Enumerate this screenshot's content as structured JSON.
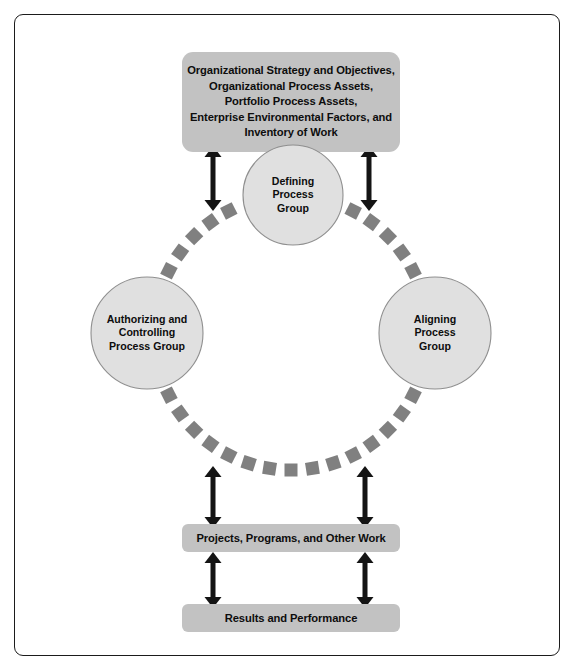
{
  "figure": {
    "background_color": "#ffffff",
    "frame_color": "#1b1b1b",
    "box_fill": "#c2c2c2",
    "circle_fill": "#e0e0e0",
    "circle_stroke": "#8f8f8f",
    "dash_color": "#808080",
    "arrow_color": "#141414",
    "text_color": "#0d0d0d"
  },
  "boxes": {
    "inputs": {
      "name": "Organizational Strategy and Objectives, Organizational Process Assets, Portfolio Process Assets, Enterprise Environmental Factors, and Inventory of Work",
      "lines": [
        "Organizational Strategy and Objectives,",
        "Organizational Process Assets,",
        "Portfolio Process Assets,",
        "Enterprise Environmental Factors, and",
        "Inventory of Work"
      ]
    },
    "projects": {
      "name": "Projects, Programs, and Other Work",
      "lines": [
        "Projects, Programs, and Other Work"
      ]
    },
    "results": {
      "name": "Results and Performance",
      "lines": [
        "Results and Performance"
      ]
    }
  },
  "circles": {
    "defining": {
      "name": "Defining Process Group",
      "lines": [
        "Defining",
        "Process",
        "Group"
      ],
      "cx": 293,
      "cy": 195,
      "r": 50
    },
    "authorizing": {
      "name": "Authorizing and Controlling Process Group",
      "lines": [
        "Authorizing and",
        "Controlling",
        "Process Group"
      ],
      "cx": 147,
      "cy": 333,
      "r": 56
    },
    "aligning": {
      "name": "Aligning Process Group",
      "lines": [
        "Aligning",
        "Process",
        "Group"
      ],
      "cx": 435,
      "cy": 333,
      "r": 56
    }
  },
  "cycle": {
    "name": "dashed process cycle",
    "cx": 291,
    "cy": 333,
    "r": 137,
    "dash_count": 40
  },
  "arrows": [
    {
      "name": "arrow-inputs-left",
      "x": 213,
      "y1": 146,
      "y2": 211
    },
    {
      "name": "arrow-inputs-right",
      "x": 369,
      "y1": 146,
      "y2": 211
    },
    {
      "name": "arrow-projects-left",
      "x": 213,
      "y1": 466,
      "y2": 528
    },
    {
      "name": "arrow-projects-right",
      "x": 365,
      "y1": 466,
      "y2": 528
    },
    {
      "name": "arrow-results-left",
      "x": 213,
      "y1": 552,
      "y2": 608
    },
    {
      "name": "arrow-results-right",
      "x": 365,
      "y1": 552,
      "y2": 608
    }
  ]
}
